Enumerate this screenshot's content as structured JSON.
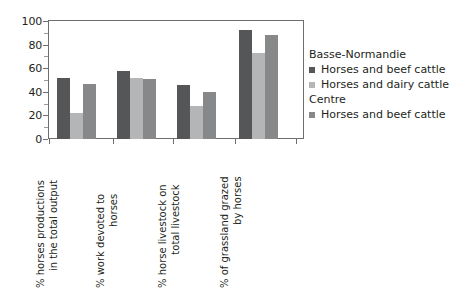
{
  "chart_data": {
    "type": "bar",
    "title": "",
    "subtitle": "",
    "xlabel": "",
    "ylabel": "",
    "ylim": [
      0,
      100
    ],
    "yticks": [
      0,
      20,
      40,
      60,
      80,
      100
    ],
    "grid": false,
    "legend_position": "right",
    "orientation": "vertical",
    "grouping": "grouped",
    "categories": [
      "% horses productions in the total output",
      "% work devoted to horses",
      "% horse livestock on total livestock",
      "% of grassland grazed by horses"
    ],
    "category_label_lines": [
      [
        "% horses productions",
        "in the total output"
      ],
      [
        "% work devoted to",
        "horses"
      ],
      [
        "% horse livestock on",
        "total livestock"
      ],
      [
        "% of grassland grazed",
        "by horses"
      ]
    ],
    "series": [
      {
        "name": "Horses and beef cattle",
        "group": "Basse-Normandie",
        "color": "#555658",
        "values": [
          52,
          58,
          46,
          92
        ]
      },
      {
        "name": "Horses and dairy cattle",
        "group": "Basse-Normandie",
        "color": "#b4b5b7",
        "values": [
          22,
          52,
          28,
          73
        ]
      },
      {
        "name": "Horses and beef cattle",
        "group": "Centre",
        "color": "#878889",
        "values": [
          47,
          51,
          40,
          88
        ]
      }
    ]
  },
  "axis": {
    "y_tick_labels": [
      "100",
      "80",
      "60",
      "40",
      "20",
      "0"
    ]
  },
  "legend": {
    "blocks": [
      {
        "heading": "Basse-Normandie",
        "items": [
          {
            "label": "Horses and beef cattle",
            "color": "#555658"
          },
          {
            "label": "Horses and dairy cattle",
            "color": "#b4b5b7"
          }
        ]
      },
      {
        "heading": "Centre",
        "items": [
          {
            "label": "Horses and beef cattle",
            "color": "#878889"
          }
        ]
      }
    ]
  }
}
